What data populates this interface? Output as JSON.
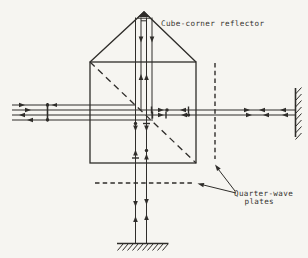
{
  "diagram": {
    "labels": {
      "cube_corner": "Cube-corner reflector",
      "qwp_line1": "Quarter-wave",
      "qwp_line2": "plates"
    },
    "colors": {
      "ink": "#2f2d2a",
      "paper": "#f6f5f1"
    },
    "components": [
      "cube-corner-reflector",
      "beam-splitter-cube",
      "beam-splitter-diagonal",
      "quarter-wave-plate-vertical",
      "quarter-wave-plate-horizontal",
      "reference-mirror-right",
      "reference-mirror-bottom",
      "laser-beam-paths"
    ]
  }
}
